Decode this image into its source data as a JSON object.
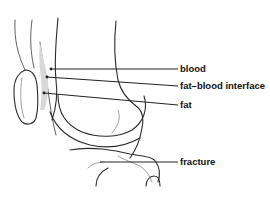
{
  "diagram": {
    "labels": [
      {
        "id": "blood",
        "text": "blood"
      },
      {
        "id": "fat-blood-interface",
        "text": "fat–blood interface"
      },
      {
        "id": "fat",
        "text": "fat"
      },
      {
        "id": "fracture",
        "text": "fracture"
      }
    ]
  }
}
